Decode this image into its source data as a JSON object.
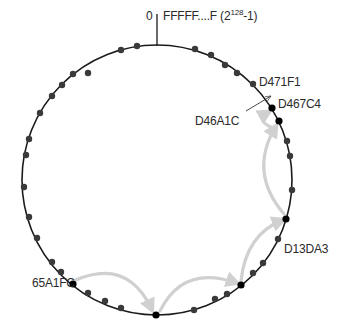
{
  "diagram": {
    "type": "hash-ring lookup",
    "ring": {
      "center": [
        157,
        180
      ],
      "radius": 135,
      "stroke_color": "#1a1a1a",
      "node_color": "#3a3a3a",
      "highlight_node_color": "#000000",
      "arrow_color": "#d0d0d0"
    },
    "origin_marker": {
      "zero_label": "0",
      "max_label_prefix": "FFFFF....F (2",
      "max_label_exp": "128",
      "max_label_suffix": "-1)"
    },
    "labels": {
      "start_node": "65A1FC",
      "hop_node": "D13DA3",
      "target_key": "D46A1C",
      "successor_node": "D467C4",
      "next_node": "D471F1"
    },
    "nodes": [
      [
        121,
        50
      ],
      [
        137,
        46
      ],
      [
        195,
        49
      ],
      [
        211,
        55
      ],
      [
        225,
        65
      ],
      [
        237,
        73
      ],
      [
        253,
        84
      ],
      [
        88,
        73
      ],
      [
        73,
        74
      ],
      [
        62,
        85
      ],
      [
        52,
        96
      ],
      [
        40,
        113
      ],
      [
        29,
        139
      ],
      [
        26,
        155
      ],
      [
        24,
        187
      ],
      [
        29,
        217
      ],
      [
        37,
        238
      ],
      [
        52,
        262
      ],
      [
        61,
        272
      ],
      [
        88,
        293
      ],
      [
        105,
        301
      ],
      [
        121,
        308
      ],
      [
        194,
        310
      ],
      [
        215,
        299
      ],
      [
        227,
        294
      ],
      [
        253,
        273
      ],
      [
        263,
        263
      ],
      [
        278,
        239
      ],
      [
        287,
        141
      ],
      [
        290,
        156
      ],
      [
        292,
        190
      ]
    ],
    "highlighted_nodes": [
      [
        73,
        284
      ],
      [
        156,
        315
      ],
      [
        241,
        285
      ],
      [
        286,
        219
      ],
      [
        279,
        121
      ],
      [
        272,
        108
      ]
    ],
    "hops": [
      {
        "from": [
          76,
          280
        ],
        "ctrl": [
          128,
          258
        ],
        "to": [
          152,
          310
        ]
      },
      {
        "from": [
          160,
          311
        ],
        "ctrl": [
          183,
          264
        ],
        "to": [
          237,
          283
        ]
      },
      {
        "from": [
          241,
          281
        ],
        "ctrl": [
          246,
          234
        ],
        "to": [
          283,
          220
        ]
      },
      {
        "from": [
          284,
          214
        ],
        "ctrl": [
          248,
          172
        ],
        "to": [
          276,
          126
        ]
      },
      {
        "from": [
          271,
          127
        ],
        "ctrl": [
          255,
          120
        ],
        "to": [
          269,
          112
        ]
      }
    ]
  }
}
